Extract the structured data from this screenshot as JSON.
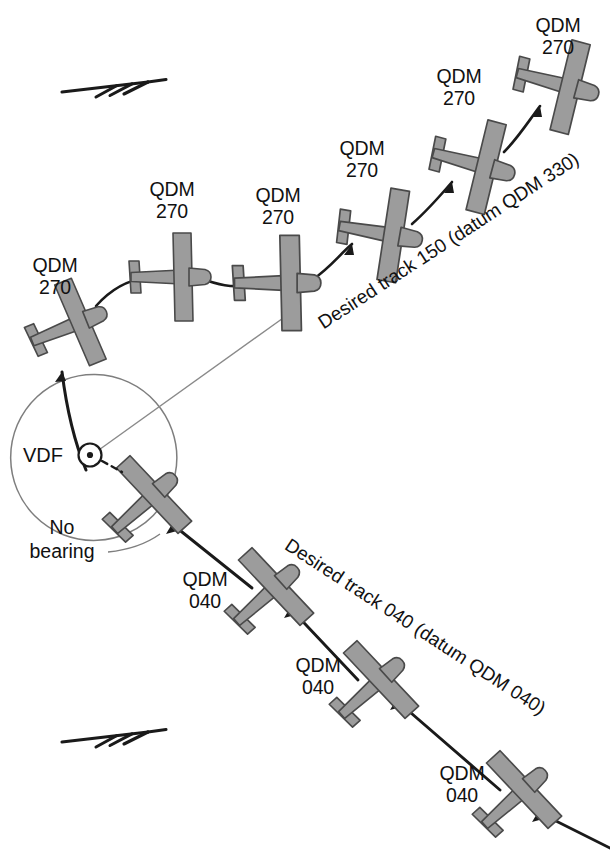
{
  "diagram": {
    "type": "aviation-navigation-vdf-homing-vs-tracking",
    "background_color": "#ffffff",
    "aircraft_fill": "#9c9c9c",
    "aircraft_stroke": "#4a4a4a",
    "line_color": "#1a1a1a",
    "thin_line_color": "#8a8a8a",
    "text_color": "#111111"
  },
  "station": {
    "label": "VDF",
    "icon": "circle-dot-station-icon",
    "x": 90,
    "y": 455
  },
  "no_bearing": {
    "line1": "No",
    "line2": "bearing"
  },
  "tracks": [
    {
      "id": "upper-track",
      "label": "Desired track 150 (datum QDM 330)",
      "track_degrees": 150,
      "datum_qdm": 330,
      "style": "dashed-curved",
      "rotation_deg": -33
    },
    {
      "id": "lower-track",
      "label": "Desired track 040 (datum QDM 040)",
      "track_degrees": 40,
      "datum_qdm": 40,
      "style": "solid-straight",
      "rotation_deg": 33
    }
  ],
  "wind_arrows": [
    {
      "id": "wind-arrow-top",
      "x": 62,
      "y": 90,
      "length": 86,
      "direction": "east"
    },
    {
      "id": "wind-arrow-bottom",
      "x": 62,
      "y": 740,
      "length": 86,
      "direction": "east"
    }
  ],
  "aircraft": [
    {
      "id": "upper-1",
      "qdm_line1": "QDM",
      "qdm_line2": "270",
      "x": 73,
      "y": 325,
      "rot": -22,
      "scale": 1.0,
      "label_x": 55,
      "label_y": 272
    },
    {
      "id": "upper-2",
      "qdm_line1": "QDM",
      "qdm_line2": "270",
      "x": 175,
      "y": 277,
      "rot": 0,
      "scale": 1.0,
      "label_x": 172,
      "label_y": 196
    },
    {
      "id": "upper-3",
      "qdm_line1": "QDM",
      "qdm_line2": "270",
      "x": 282,
      "y": 283,
      "rot": 0,
      "scale": 1.08,
      "label_x": 278,
      "label_y": 202
    },
    {
      "id": "upper-4",
      "qdm_line1": "QDM",
      "qdm_line2": "270",
      "x": 385,
      "y": 234,
      "rot": 10,
      "scale": 1.05,
      "label_x": 362,
      "label_y": 155
    },
    {
      "id": "upper-5",
      "qdm_line1": "QDM",
      "qdm_line2": "270",
      "x": 478,
      "y": 165,
      "rot": 15,
      "scale": 1.05,
      "label_x": 459,
      "label_y": 83
    },
    {
      "id": "upper-6",
      "qdm_line1": "QDM",
      "qdm_line2": "270",
      "x": 562,
      "y": 85,
      "rot": 15,
      "scale": 1.05,
      "label_x": 546,
      "label_y": 32
    },
    {
      "id": "station-aircraft",
      "qdm_line1": "",
      "qdm_line2": "",
      "x": 148,
      "y": 500,
      "rot": -42,
      "scale": 1.02,
      "label_x": 0,
      "label_y": 0
    },
    {
      "id": "lower-1",
      "qdm_line1": "QDM",
      "qdm_line2": "040",
      "x": 270,
      "y": 592,
      "rot": -42,
      "scale": 1.02,
      "label_x": 205,
      "label_y": 586
    },
    {
      "id": "lower-2",
      "qdm_line1": "QDM",
      "qdm_line2": "040",
      "x": 375,
      "y": 685,
      "rot": -42,
      "scale": 1.02,
      "label_x": 318,
      "label_y": 672
    },
    {
      "id": "lower-3",
      "qdm_line1": "QDM",
      "qdm_line2": "040",
      "x": 518,
      "y": 795,
      "rot": -42,
      "scale": 1.02,
      "label_x": 462,
      "label_y": 780
    }
  ]
}
